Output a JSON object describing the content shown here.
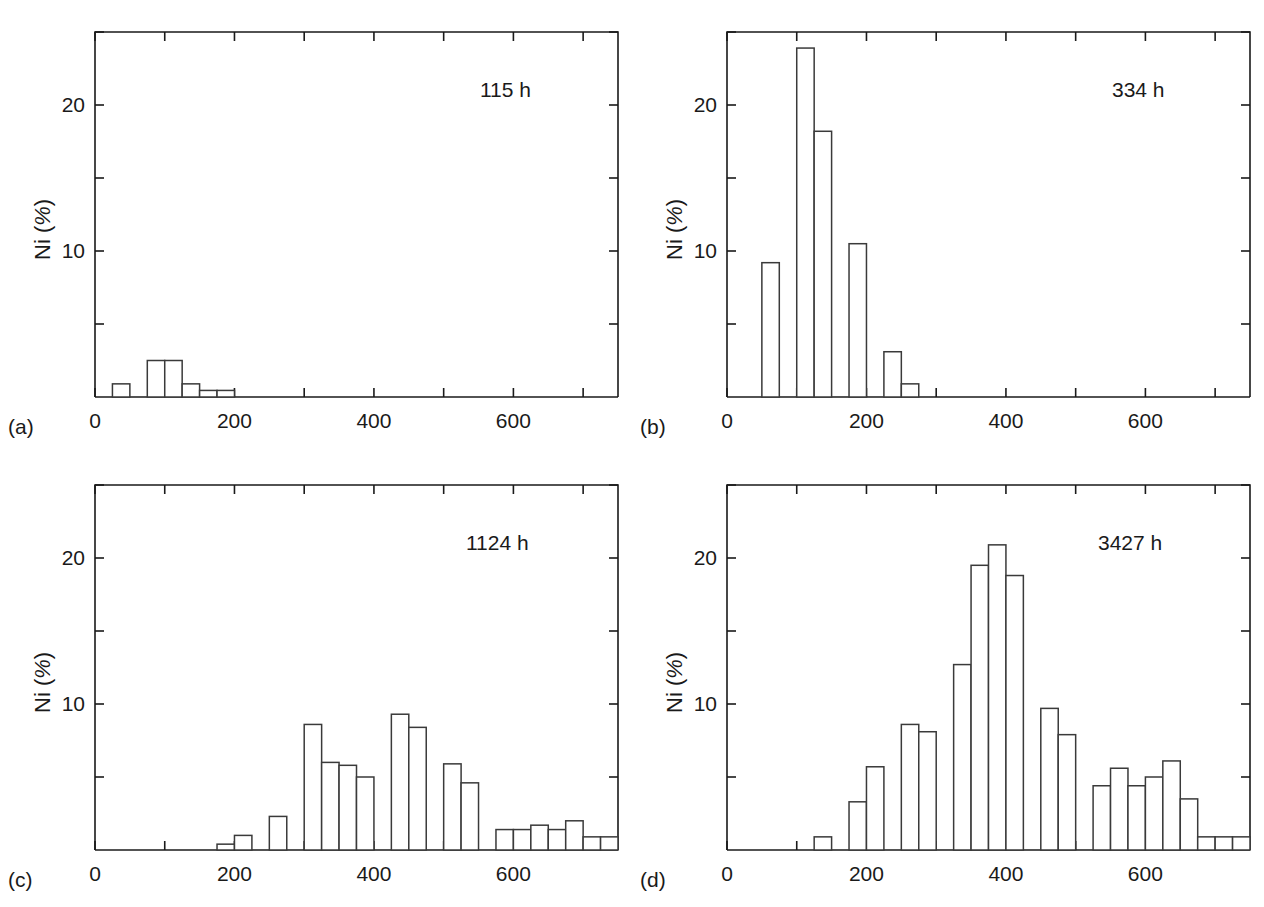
{
  "figure": {
    "panel_count": 4,
    "axis": {
      "ylabel_prefix": "Ni (",
      "ylabel_pct": "%",
      "ylabel_suffix": ")",
      "xtick_labels": [
        "0",
        "200",
        "400",
        "600"
      ],
      "ytick_labels": [
        "10",
        "20"
      ]
    },
    "panels": [
      {
        "tag": "(a)",
        "time": "115 h"
      },
      {
        "tag": "(b)",
        "time": "334 h"
      },
      {
        "tag": "(c)",
        "time": "1124 h"
      },
      {
        "tag": "(d)",
        "time": "3427 h"
      }
    ]
  },
  "chart_data": [
    {
      "type": "bar",
      "title": "115 h",
      "panel": "(a)",
      "xlabel": "",
      "ylabel": "Ni (%)",
      "xlim": [
        0,
        750
      ],
      "ylim": [
        0,
        25
      ],
      "xticks": [
        0,
        200,
        400,
        600
      ],
      "yticks": [
        10,
        20
      ],
      "bin_width": 25,
      "grid": false,
      "legend": "none",
      "bin_starts": [
        25,
        75,
        100,
        125,
        150,
        175,
        200
      ],
      "values": [
        0.9,
        2.5,
        2.5,
        0.9,
        0.45,
        0.45,
        0.0
      ]
    },
    {
      "type": "bar",
      "title": "334 h",
      "panel": "(b)",
      "xlabel": "",
      "ylabel": "Ni (%)",
      "xlim": [
        0,
        750
      ],
      "ylim": [
        0,
        25
      ],
      "xticks": [
        0,
        200,
        400,
        600
      ],
      "yticks": [
        10,
        20
      ],
      "bin_width": 25,
      "grid": false,
      "legend": "none",
      "bin_starts": [
        50,
        75,
        100,
        125,
        150,
        175,
        200,
        225,
        250
      ],
      "values": [
        9.2,
        0.0,
        23.9,
        18.2,
        0.0,
        10.5,
        0.0,
        3.1,
        0.9
      ]
    },
    {
      "type": "bar",
      "title": "1124 h",
      "panel": "(c)",
      "xlabel": "",
      "ylabel": "Ni (%)",
      "xlim": [
        0,
        750
      ],
      "ylim": [
        0,
        25
      ],
      "xticks": [
        0,
        200,
        400,
        600
      ],
      "yticks": [
        10,
        20
      ],
      "bin_width": 25,
      "grid": false,
      "legend": "none",
      "bin_starts": [
        175,
        200,
        225,
        250,
        275,
        300,
        325,
        350,
        375,
        400,
        425,
        450,
        475,
        500,
        525,
        550,
        575,
        600,
        625,
        650,
        675,
        700,
        725
      ],
      "values": [
        0.4,
        1.0,
        0.0,
        2.3,
        0.0,
        8.6,
        6.0,
        5.8,
        5.0,
        0.0,
        9.3,
        8.4,
        0.0,
        5.9,
        4.6,
        0.0,
        1.4,
        1.4,
        1.7,
        1.4,
        2.0,
        0.9,
        0.9
      ]
    },
    {
      "type": "bar",
      "title": "3427 h",
      "panel": "(d)",
      "xlabel": "",
      "ylabel": "Ni (%)",
      "xlim": [
        0,
        750
      ],
      "ylim": [
        0,
        25
      ],
      "xticks": [
        0,
        200,
        400,
        600
      ],
      "yticks": [
        10,
        20
      ],
      "bin_width": 25,
      "grid": false,
      "legend": "none",
      "bin_starts": [
        125,
        150,
        175,
        200,
        225,
        250,
        275,
        300,
        325,
        350,
        375,
        400,
        425,
        450,
        475,
        500,
        525,
        550,
        575,
        600,
        625,
        650,
        675,
        700,
        725
      ],
      "values": [
        0.9,
        0.0,
        3.3,
        5.7,
        0.0,
        8.6,
        8.1,
        0.0,
        12.7,
        19.5,
        20.9,
        18.8,
        0.0,
        9.7,
        7.9,
        0.0,
        4.4,
        5.6,
        4.4,
        5.0,
        6.1,
        3.5,
        0.9,
        0.9,
        0.9
      ]
    }
  ]
}
